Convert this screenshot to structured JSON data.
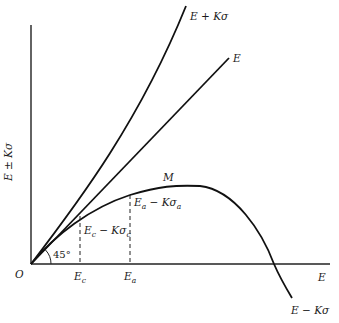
{
  "figure": {
    "y_axis_label": "E ± Kσ",
    "x_axis_label": "E",
    "origin_label": "O",
    "angle_label": "45°",
    "curves": {
      "upper": {
        "label": "E + Kσ"
      },
      "mean": {
        "label": "E"
      },
      "lower": {
        "label": "E − Kσ",
        "peak_label": "M"
      }
    },
    "points": {
      "c": {
        "x_label": "Ec",
        "x_base": "E",
        "x_sub": "c",
        "y_label_base": "E",
        "y_label_sub1": "c",
        "y_label_mid": " − Kσ",
        "y_label_sub2": "c"
      },
      "a": {
        "x_label": "Ea",
        "x_base": "E",
        "x_sub": "a",
        "y_label_base": "E",
        "y_label_sub1": "a",
        "y_label_mid": " − Kσ",
        "y_label_sub2": "a"
      }
    }
  }
}
